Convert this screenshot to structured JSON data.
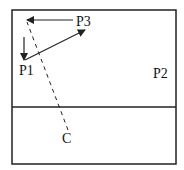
{
  "diagram": {
    "court": {
      "x": 12,
      "y": 10,
      "width": 164,
      "height": 154,
      "midline_y": 107,
      "stroke": "#222222"
    },
    "labels": {
      "p1": "P1",
      "p2": "P2",
      "p3": "P3",
      "c": "C"
    },
    "arrows": [
      {
        "id": "p3-to-left",
        "from": [
          73,
          20
        ],
        "to": [
          26,
          20
        ],
        "style": "solid"
      },
      {
        "id": "p1-to-p3",
        "from": [
          25,
          60
        ],
        "to": [
          85,
          30
        ],
        "style": "solid"
      },
      {
        "id": "down-to-p1",
        "from": [
          24,
          37
        ],
        "to": [
          24,
          60
        ],
        "style": "solid"
      },
      {
        "id": "c-path",
        "from": [
          68,
          130
        ],
        "to": [
          27,
          22
        ],
        "style": "dashed"
      }
    ],
    "colors": {
      "line": "#222222",
      "text": "#111111",
      "background": "#ffffff"
    }
  }
}
